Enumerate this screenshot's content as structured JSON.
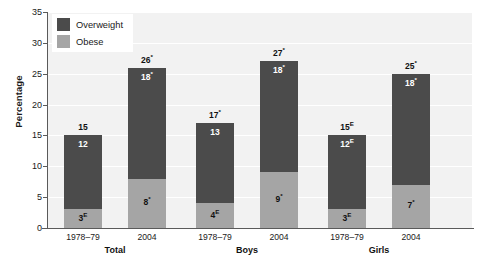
{
  "chart_data": {
    "type": "bar",
    "subtype": "stacked-bar",
    "title": "",
    "xlabel": "",
    "ylabel": "Percentage",
    "ylim": [
      0,
      35
    ],
    "ytick_step": 5,
    "yticks": [
      "0",
      "5",
      "10",
      "15",
      "20",
      "25",
      "30",
      "35"
    ],
    "grid": true,
    "grid_orientation": "horizontal",
    "legend": {
      "position": "top-left-inside",
      "entries": [
        {
          "label": "Overweight",
          "color": "#4b4b4b"
        },
        {
          "label": "Obese",
          "color": "#a5a5a5"
        }
      ]
    },
    "groups": [
      {
        "name": "Total",
        "categories": [
          "1978–79",
          "2004"
        ]
      },
      {
        "name": "Boys",
        "categories": [
          "1978–79",
          "2004"
        ]
      },
      {
        "name": "Girls",
        "categories": [
          "1978–79",
          "2004"
        ]
      }
    ],
    "series": [
      {
        "name": "Overweight",
        "color": "#4b4b4b",
        "values": [
          12,
          18,
          13,
          18,
          12,
          18
        ]
      },
      {
        "name": "Obese",
        "color": "#a5a5a5",
        "values": [
          3,
          8,
          4,
          9,
          3,
          7
        ]
      }
    ],
    "bars": [
      {
        "group": "Total",
        "category": "1978–79",
        "total": 15,
        "total_label": "15",
        "total_label_sup": "",
        "overweight": 12,
        "overweight_label": "12",
        "overweight_label_sup": "",
        "obese": 3,
        "obese_label": "3",
        "obese_label_sup": "E"
      },
      {
        "group": "Total",
        "category": "2004",
        "total": 26,
        "total_label": "26",
        "total_label_sup": "*",
        "overweight": 18,
        "overweight_label": "18",
        "overweight_label_sup": "*",
        "obese": 8,
        "obese_label": "8",
        "obese_label_sup": "*"
      },
      {
        "group": "Boys",
        "category": "1978–79",
        "total": 17,
        "total_label": "17",
        "total_label_sup": "*",
        "overweight": 13,
        "overweight_label": "13",
        "overweight_label_sup": "",
        "obese": 4,
        "obese_label": "4",
        "obese_label_sup": "E"
      },
      {
        "group": "Boys",
        "category": "2004",
        "total": 27,
        "total_label": "27",
        "total_label_sup": "*",
        "overweight": 18,
        "overweight_label": "18",
        "overweight_label_sup": "*",
        "obese": 9,
        "obese_label": "9",
        "obese_label_sup": "*"
      },
      {
        "group": "Girls",
        "category": "1978–79",
        "total": 15,
        "total_label": "15",
        "total_label_sup": "E",
        "overweight": 12,
        "overweight_label": "12",
        "overweight_label_sup": "E",
        "obese": 3,
        "obese_label": "3",
        "obese_label_sup": "E"
      },
      {
        "group": "Girls",
        "category": "2004",
        "total": 25,
        "total_label": "25",
        "total_label_sup": "*",
        "overweight": 18,
        "overweight_label": "18",
        "overweight_label_sup": "*",
        "obese": 7,
        "obese_label": "7",
        "obese_label_sup": "*"
      }
    ],
    "colors": {
      "overweight": "#4b4b4b",
      "obese": "#a5a5a5",
      "plot_background": "#f2f2f2",
      "gridline": "#ffffff",
      "axis": "#5a5a5a",
      "text": "#1a1a1a"
    }
  }
}
